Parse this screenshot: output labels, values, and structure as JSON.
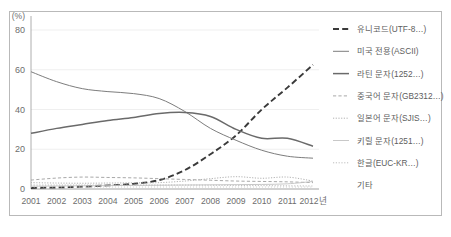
{
  "axes": {
    "y_unit_label": "(%)",
    "y_ticks": [
      "0",
      "20",
      "40",
      "60",
      "80"
    ],
    "x_ticks": [
      "2001",
      "2002",
      "2003",
      "2004",
      "2005",
      "2006",
      "2007",
      "2008",
      "2009",
      "2010",
      "2011",
      "2012년"
    ]
  },
  "legend": {
    "items": [
      {
        "label": "유니코드(UTF-8…)",
        "style": "dashed-bold",
        "color": "#3a3a3a"
      },
      {
        "label": "미국 전용(ASCII)",
        "style": "solid",
        "color": "#7d7d7d"
      },
      {
        "label": "라틴 문자(1252…)",
        "style": "solid-bold",
        "color": "#6a6a6a"
      },
      {
        "label": "중국어 문자(GB2312…)",
        "style": "dashed-small",
        "color": "#9e9e9e"
      },
      {
        "label": "일본어 문자(SJIS…)",
        "style": "dotted-fine",
        "color": "#a8a8a8"
      },
      {
        "label": "키릴 문자(1251…)",
        "style": "solid-light",
        "color": "#c2c2c2"
      },
      {
        "label": "한글(EUC-KR…)",
        "style": "dotted",
        "color": "#b5b5b5"
      },
      {
        "label": "기타",
        "style": "none",
        "color": "#c9c9c9"
      }
    ]
  },
  "chart_data": {
    "type": "line",
    "title": "",
    "xlabel": "",
    "ylabel": "(%)",
    "ylim": [
      0,
      80
    ],
    "grid": true,
    "legend_position": "right",
    "categories": [
      "2001",
      "2002",
      "2003",
      "2004",
      "2005",
      "2006",
      "2007",
      "2008",
      "2009",
      "2010",
      "2011",
      "2012"
    ],
    "series": [
      {
        "name": "유니코드(UTF-8…)",
        "values": [
          0.5,
          0.8,
          1.2,
          1.8,
          2.6,
          4.5,
          9.5,
          17.5,
          27.0,
          40.0,
          51.0,
          62.5
        ]
      },
      {
        "name": "미국 전용(ASCII)",
        "values": [
          59.0,
          54.0,
          50.5,
          49.0,
          48.0,
          45.5,
          39.0,
          30.5,
          24.5,
          19.5,
          16.5,
          15.5
        ]
      },
      {
        "name": "라틴 문자(1252…)",
        "values": [
          28.0,
          30.5,
          32.5,
          34.5,
          36.0,
          38.0,
          38.5,
          36.5,
          30.0,
          25.5,
          25.5,
          21.5
        ]
      },
      {
        "name": "중국어 문자(GB2312…)",
        "values": [
          4.5,
          5.5,
          6.0,
          5.8,
          5.6,
          5.2,
          4.8,
          4.4,
          4.0,
          3.8,
          3.6,
          3.2
        ]
      },
      {
        "name": "일본어 문자(SJIS…)",
        "values": [
          3.2,
          3.0,
          2.9,
          3.0,
          3.1,
          3.2,
          4.0,
          5.2,
          6.2,
          5.4,
          6.0,
          4.0
        ]
      },
      {
        "name": "키릴 문자(1251…)",
        "values": [
          1.4,
          1.5,
          1.6,
          1.7,
          1.8,
          1.9,
          2.0,
          2.1,
          2.2,
          2.3,
          2.6,
          3.8
        ]
      },
      {
        "name": "한글(EUC-KR…)",
        "values": [
          2.0,
          2.0,
          2.0,
          2.0,
          2.0,
          2.0,
          2.0,
          1.9,
          1.8,
          1.7,
          1.6,
          1.5
        ]
      },
      {
        "name": "기타",
        "values": [
          1.0,
          1.0,
          1.0,
          1.0,
          1.0,
          1.0,
          1.0,
          1.0,
          1.0,
          1.0,
          1.0,
          1.0
        ]
      }
    ]
  }
}
